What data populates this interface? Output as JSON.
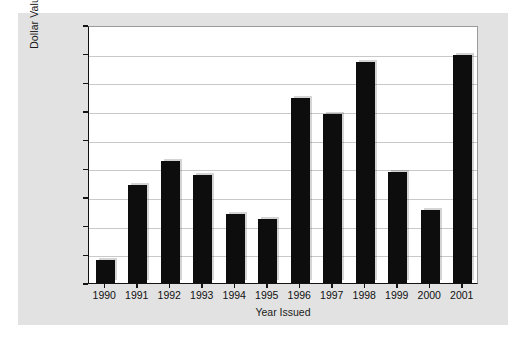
{
  "chart_data": {
    "type": "bar",
    "title": "",
    "xlabel": "Year Issued",
    "ylabel": "Dollar Value Issued ($ in billions)",
    "categories": [
      "1990",
      "1991",
      "1992",
      "1993",
      "1994",
      "1995",
      "1996",
      "1997",
      "1998",
      "1999",
      "2000",
      "2001"
    ],
    "values": [
      4.0,
      17.1,
      21.3,
      18.8,
      12.1,
      11.2,
      32.2,
      29.5,
      38.5,
      19.4,
      12.7,
      39.7
    ],
    "ylim": [
      0,
      45
    ],
    "ytick_values": [
      0,
      5,
      10,
      15,
      20,
      25,
      30,
      35,
      40,
      45
    ],
    "ytick_labels": [
      "0",
      "5",
      "10",
      "15",
      "20",
      "25",
      "30",
      "35",
      "40",
      "45"
    ],
    "grid": true,
    "legend": "none",
    "bar_color": "#0d0d0d",
    "panel_color": "#e2e2e2",
    "plot_background": "#ffffff",
    "gridline_color": "#c9c9c9",
    "axis_color": "#121212"
  }
}
